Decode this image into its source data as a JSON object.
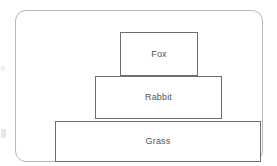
{
  "diagram": {
    "type": "ecological-pyramid",
    "frame": {
      "shape": "rounded-rectangle",
      "border_color": "#b9b9b9",
      "background_color": "#ffffff"
    },
    "box_style": {
      "border_color": "#6e6e6e",
      "fill_color": "#ffffff",
      "text_color": "#555555"
    },
    "levels": [
      {
        "id": "fox",
        "label": "Fox",
        "position": "top"
      },
      {
        "id": "rabbit",
        "label": "Rabbit",
        "position": "middle"
      },
      {
        "id": "grass",
        "label": "Grass",
        "position": "bottom"
      }
    ]
  }
}
